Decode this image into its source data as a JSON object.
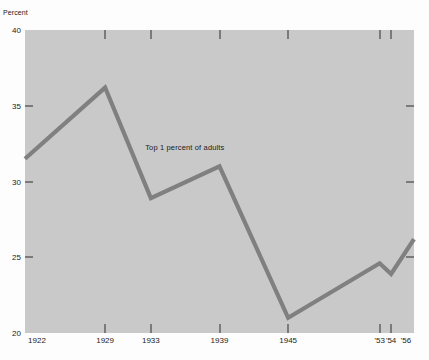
{
  "chart_data": {
    "type": "line",
    "title": "",
    "subtitle": "",
    "xlabel": "",
    "ylabel": "Percent",
    "ylim": [
      20,
      40
    ],
    "xlim": [
      1922,
      1956
    ],
    "grid": false,
    "legend": "none",
    "annotations": [
      {
        "text": "Top 1 percent of adults",
        "x": 1936.0,
        "y": 32.2
      }
    ],
    "y_ticks": [
      40,
      35,
      30,
      25,
      20
    ],
    "y_tick_labels": [
      "40",
      "35",
      "30",
      "25",
      "20"
    ],
    "x_ticks": [
      1922,
      1929,
      1933,
      1939,
      1945,
      1953,
      1954,
      1956
    ],
    "x_tick_labels": [
      "1922",
      "1929",
      "1933",
      "1939",
      "1945",
      "'53",
      "'54",
      "'56"
    ],
    "series": [
      {
        "name": "Top 1 percent of adults",
        "color": "#808080",
        "x": [
          1922,
          1929,
          1933,
          1939,
          1945,
          1953,
          1954,
          1956
        ],
        "values": [
          31.5,
          36.2,
          28.9,
          31.0,
          21.0,
          24.6,
          23.9,
          26.2
        ]
      }
    ]
  },
  "axis": {
    "unit_label": "Percent"
  },
  "colors": {
    "plot_background": "#c9c9c9",
    "page_background": "#fdfdfd",
    "line": "#808080",
    "tick": "#2c2c2c",
    "text": "#1b1b1b"
  }
}
